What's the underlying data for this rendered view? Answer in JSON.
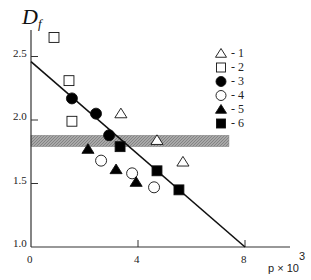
{
  "chart_data": {
    "type": "scatter",
    "title": "",
    "ylabel": "D_f",
    "ylabel_main": "D",
    "ylabel_sub": "f",
    "xlabel": "p × 10",
    "xlabel_main": "p × 10",
    "xlabel_exp": "3",
    "xlim": [
      0,
      9
    ],
    "ylim": [
      1.0,
      2.75
    ],
    "xticks": [
      0,
      4,
      8
    ],
    "xtick_labels": [
      "0",
      "4",
      "8"
    ],
    "yticks": [
      1.0,
      1.5,
      2.0,
      2.5
    ],
    "ytick_labels": [
      "1.0",
      "1.5",
      "2.0",
      "2.5"
    ],
    "grid": false,
    "legend_position": "upper right",
    "fit_line": {
      "x": [
        0,
        8
      ],
      "y": [
        2.46,
        1.0
      ]
    },
    "shaded_band": {
      "x": [
        0,
        7.4
      ],
      "y": [
        1.79,
        1.88
      ],
      "color": "#9a9a9a"
    },
    "series": [
      {
        "name": "1",
        "marker": "open-triangle",
        "x": [
          3.36,
          4.71,
          5.68
        ],
        "y": [
          2.05,
          1.84,
          1.67
        ]
      },
      {
        "name": "2",
        "marker": "open-square",
        "x": [
          0.86,
          1.42,
          1.53
        ],
        "y": [
          2.65,
          2.31,
          1.99
        ]
      },
      {
        "name": "3",
        "marker": "filled-circle",
        "x": [
          1.53,
          2.43,
          2.92
        ],
        "y": [
          2.17,
          2.05,
          1.88
        ]
      },
      {
        "name": "4",
        "marker": "open-circle",
        "x": [
          2.62,
          3.78,
          4.6
        ],
        "y": [
          1.68,
          1.58,
          1.47
        ]
      },
      {
        "name": "5",
        "marker": "filled-triangle",
        "x": [
          2.13,
          3.18,
          3.93
        ],
        "y": [
          1.77,
          1.61,
          1.51
        ]
      },
      {
        "name": "6",
        "marker": "filled-square",
        "x": [
          3.33,
          4.71,
          5.53
        ],
        "y": [
          1.79,
          1.6,
          1.45
        ]
      }
    ]
  },
  "legend": {
    "items": [
      {
        "label": "- 1",
        "marker": "open-triangle"
      },
      {
        "label": "- 2",
        "marker": "open-square"
      },
      {
        "label": "- 3",
        "marker": "filled-circle"
      },
      {
        "label": "- 4",
        "marker": "open-circle"
      },
      {
        "label": "- 5",
        "marker": "filled-triangle"
      },
      {
        "label": "- 6",
        "marker": "filled-square"
      }
    ]
  }
}
